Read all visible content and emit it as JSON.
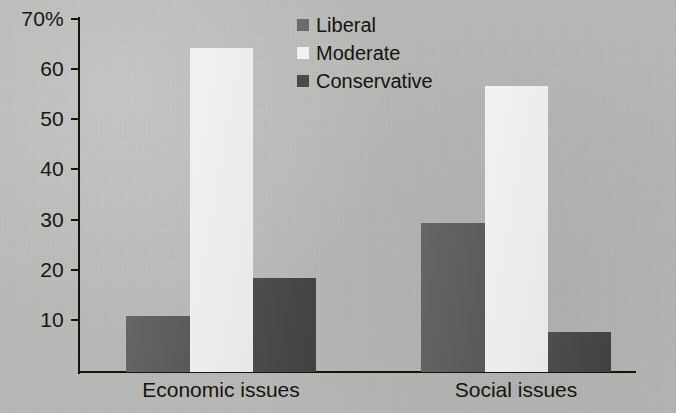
{
  "chart_data": {
    "type": "bar",
    "title": "",
    "subtitle": "",
    "xlabel": "",
    "ylabel": "",
    "categories": [
      "Economic issues",
      "Social issues"
    ],
    "series": [
      {
        "name": "Liberal",
        "values": [
          11,
          29.5
        ],
        "color": "#5e5e5c"
      },
      {
        "name": "Moderate",
        "values": [
          64,
          56.5
        ],
        "color": "#f0f0ee"
      },
      {
        "name": "Conservative",
        "values": [
          18.5,
          8
        ],
        "color": "#464644"
      }
    ],
    "ylim": [
      0,
      70
    ],
    "y_ticks": [
      70,
      60,
      50,
      40,
      30,
      20,
      10
    ],
    "y_tick_labels": [
      "70%",
      "60",
      "50",
      "40",
      "30",
      "20",
      "10"
    ],
    "grid": false,
    "legend_position": "top-center",
    "units": "percent",
    "background_color": "#b9b9b7",
    "axis_color": "#15140f"
  },
  "legend": {
    "items": [
      {
        "label": "Liberal",
        "swatch": "liberal"
      },
      {
        "label": "Moderate",
        "swatch": "moderate"
      },
      {
        "label": "Conservative",
        "swatch": "conservative"
      }
    ]
  },
  "axis": {
    "y_labels": [
      "70%",
      "60",
      "50",
      "40",
      "30",
      "20",
      "10"
    ],
    "x_labels": [
      "Economic issues",
      "Social issues"
    ]
  }
}
